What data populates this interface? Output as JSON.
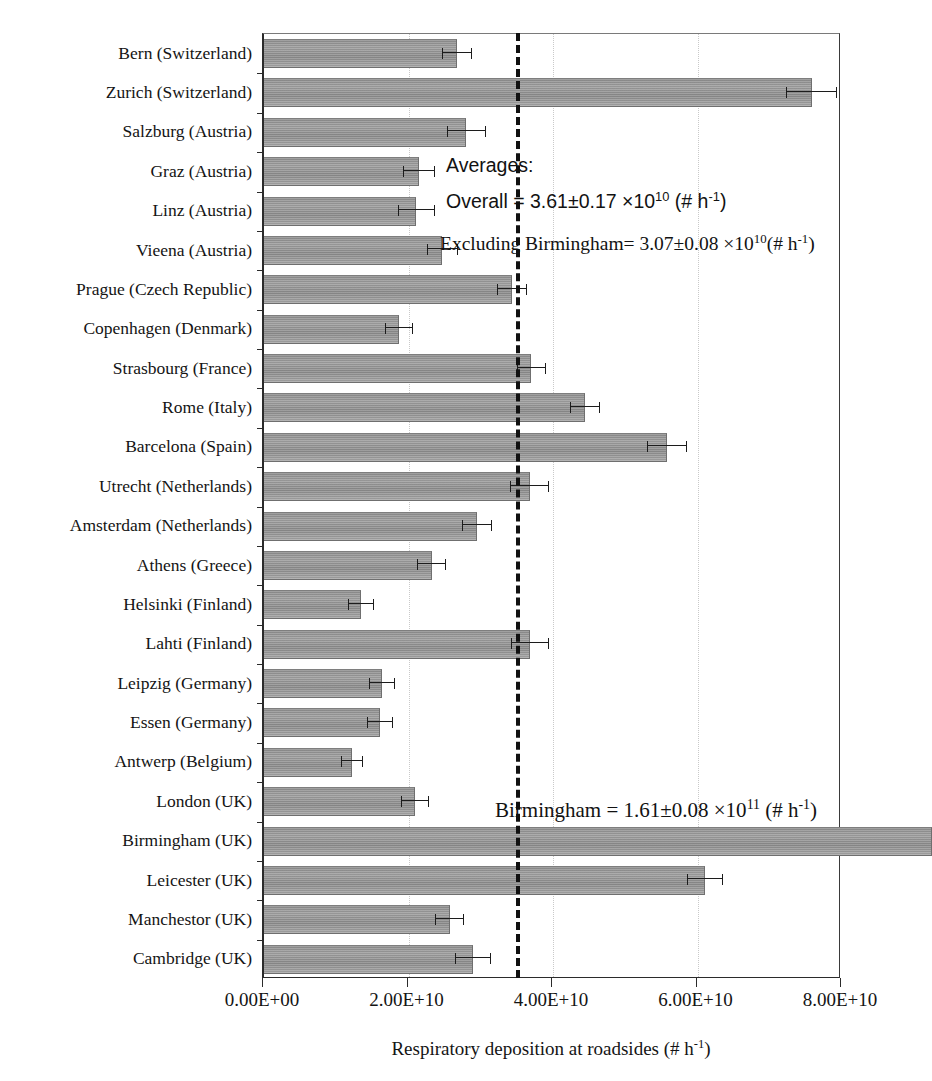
{
  "chart_data": {
    "type": "bar",
    "orientation": "horizontal",
    "title": "",
    "xlabel": "Respiratory deposition at roadsides (# h-1)",
    "ylabel": "",
    "xlim": [
      0,
      80000000000
    ],
    "xticks": [
      "0.00E+00",
      "2.00E+10",
      "4.00E+10",
      "6.00E+10",
      "8.00E+10"
    ],
    "xtick_values": [
      0,
      20000000000,
      40000000000,
      60000000000,
      80000000000
    ],
    "grid": "vertical dotted gridlines at 2.00E+10, 4.00E+10, 6.00E+10",
    "legend": "none",
    "categories": [
      "Bern (Switzerland)",
      "Zurich (Switzerland)",
      "Salzburg (Austria)",
      "Graz (Austria)",
      "Linz (Austria)",
      "Vieena (Austria)",
      "Prague (Czech Republic)",
      "Copenhagen (Denmark)",
      "Strasbourg (France)",
      "Rome (Italy)",
      "Barcelona (Spain)",
      "Utrecht (Netherlands)",
      "Amsterdam (Netherlands)",
      "Athens (Greece)",
      "Helsinki (Finland)",
      "Lahti (Finland)",
      "Leipzig (Germany)",
      "Essen (Germany)",
      "Antwerp (Belgium)",
      "London (UK)",
      "Birmingham (UK)",
      "Leicester (UK)",
      "Manchestor (UK)",
      "Cambridge (UK)"
    ],
    "values": [
      26700000000.0,
      75800000000.0,
      28000000000.0,
      21500000000.0,
      21100000000.0,
      24700000000.0,
      34300000000.0,
      18700000000.0,
      37000000000.0,
      44400000000.0,
      55800000000.0,
      36800000000.0,
      29500000000.0,
      23200000000.0,
      13400000000.0,
      36800000000.0,
      16300000000.0,
      16100000000.0,
      12200000000.0,
      20900000000.0,
      161000000000.0,
      61000000000.0,
      25700000000.0,
      28900000000.0
    ],
    "errors": [
      2100000000.0,
      3500000000.0,
      2700000000.0,
      2200000000.0,
      2500000000.0,
      2200000000.0,
      2100000000.0,
      1900000000.0,
      2000000000.0,
      2100000000.0,
      2800000000.0,
      2700000000.0,
      2100000000.0,
      2000000000.0,
      1800000000.0,
      2600000000.0,
      1800000000.0,
      1800000000.0,
      1500000000.0,
      1900000000.0,
      8000000000.0,
      2500000000.0,
      2000000000.0,
      2500000000.0
    ],
    "reference_line": {
      "value": 34900000000.0,
      "style": "dashed",
      "label": "Overall average"
    },
    "annotations": {
      "averages_heading": "Averages:",
      "overall": "Overall = 3.61±0.17 ×10",
      "overall_exp": "10",
      "overall_unit": " (# h",
      "overall_unit_exp": "-1",
      "overall_unit_close": ")",
      "excluding_label": "Excluding Birmingham= 3.07±0.08 ×10",
      "excluding_exp": "10",
      "excluding_unit": "(# h",
      "excluding_unit_exp": "-1",
      "excluding_unit_close": ")",
      "birmingham_label": "Birmingham = 1.61±0.08 ×10",
      "birmingham_exp": "11",
      "birmingham_unit": " (# h",
      "birmingham_unit_exp": "-1",
      "birmingham_unit_close": ")"
    },
    "axis_title_parts": {
      "main": "Respiratory deposition at roadsides (# h",
      "exp": "-1",
      "close": ")"
    },
    "colors": {
      "bar_fill": "#9a9a9a",
      "bar_edge": "#6f6f6f",
      "axis": "#2b2b2b",
      "gridline": "#c9c9c9",
      "reference_line": "#111111",
      "text": "#141414",
      "background": "#ffffff"
    }
  }
}
